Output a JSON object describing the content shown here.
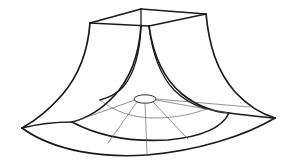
{
  "figure": {
    "background_color": "#ffffff",
    "line_color": "#1a1a1a",
    "light_line_color": "#5a5a5a",
    "width": 289,
    "height": 164,
    "parts": {
      "top_rim_label": "square top rim",
      "side_profile_label": "flared side profile curve",
      "base_arc_label": "base boundary arc",
      "radial_label": "radial grid line",
      "throat_label": "center throat ellipse"
    },
    "top_rim": {
      "left": [
        90,
        23
      ],
      "back": [
        141,
        9
      ],
      "right": [
        206,
        14
      ],
      "front": [
        149,
        26
      ]
    },
    "throat": {
      "cx": 145,
      "cy": 99,
      "rx": 11,
      "ry": 4.2
    },
    "base_corners": {
      "left": [
        22,
        128
      ],
      "front": [
        147,
        155
      ],
      "right": [
        275,
        118
      ],
      "mid_left": [
        72,
        122
      ],
      "mid_right": [
        229,
        113
      ]
    }
  }
}
